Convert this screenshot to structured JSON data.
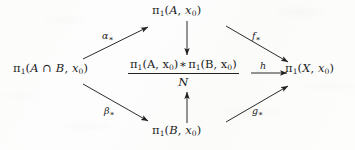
{
  "figure": {
    "kind": "commutative-diagram",
    "background_color": "#fdfdfd",
    "ink_color": "#1d1d1d"
  },
  "nodes": {
    "top": {
      "id": "pi1-A",
      "pi": "π",
      "pi_sub": "1",
      "open": "(",
      "arg": "A",
      "comma": ", ",
      "base": "x",
      "base_sub": "0",
      "close": ")"
    },
    "left": {
      "id": "pi1-A-cap-B",
      "pi": "π",
      "pi_sub": "1",
      "open": "(",
      "arg_first": "A",
      "cap": " ∩ ",
      "arg_second": "B",
      "comma": ", ",
      "base": "x",
      "base_sub": "0",
      "close": ")"
    },
    "bottom": {
      "id": "pi1-B",
      "pi": "π",
      "pi_sub": "1",
      "open": "(",
      "arg": "B",
      "comma": ", ",
      "base": "x",
      "base_sub": "0",
      "close": ")"
    },
    "right": {
      "id": "pi1-X",
      "pi": "π",
      "pi_sub": "1",
      "open": "(",
      "arg": "X",
      "comma": ", ",
      "base": "x",
      "base_sub": "0",
      "close": ")"
    },
    "center": {
      "id": "free-product-mod-N",
      "numerator": {
        "left_pi": "π",
        "left_pi_sub": "1",
        "left_open": "(",
        "left_arg": "A",
        "left_comma": ", ",
        "left_base": "x",
        "left_base_sub": "0",
        "left_close": ")",
        "operator": "∗",
        "right_pi": "π",
        "right_pi_sub": "1",
        "right_open": "(",
        "right_arg": "B",
        "right_comma": ", ",
        "right_base": "x",
        "right_base_sub": "0",
        "right_close": ")"
      },
      "denominator": "N"
    }
  },
  "arrows": [
    {
      "id": "alpha-star",
      "from": "pi1-A-cap-B",
      "to": "pi1-A",
      "label": "α",
      "label_sub": "∗",
      "direction": "up-right"
    },
    {
      "id": "beta-star",
      "from": "pi1-A-cap-B",
      "to": "pi1-B",
      "label": "β",
      "label_sub": "∗",
      "direction": "down-right"
    },
    {
      "id": "f-star",
      "from": "pi1-A",
      "to": "pi1-X",
      "label": "f",
      "label_sub": "∗",
      "direction": "down-right"
    },
    {
      "id": "g-star",
      "from": "pi1-B",
      "to": "pi1-X",
      "label": "g",
      "label_sub": "∗",
      "direction": "up-right"
    },
    {
      "id": "top-inclusion",
      "from": "pi1-A",
      "to": "free-product-mod-N",
      "label": "",
      "direction": "down"
    },
    {
      "id": "bottom-inclusion",
      "from": "pi1-B",
      "to": "free-product-mod-N",
      "label": "",
      "direction": "up"
    },
    {
      "id": "h-map",
      "from": "free-product-mod-N",
      "to": "pi1-X",
      "label": "h",
      "label_sub": "",
      "direction": "right"
    }
  ]
}
